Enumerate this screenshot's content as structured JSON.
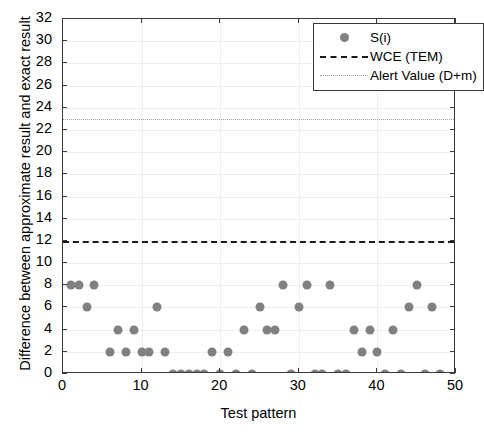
{
  "chart_data": {
    "type": "scatter",
    "title": "",
    "xlabel": "Test pattern",
    "ylabel": "Difference between approximate result and exact result",
    "xlim": [
      0,
      50
    ],
    "ylim": [
      0,
      32
    ],
    "xticks": [
      0,
      10,
      20,
      30,
      40,
      50
    ],
    "yticks": [
      0,
      2,
      4,
      6,
      8,
      10,
      12,
      14,
      16,
      18,
      20,
      22,
      24,
      26,
      28,
      30,
      32
    ],
    "grid": true,
    "legend_position": "top-right",
    "series": [
      {
        "name": "S(i)",
        "type": "scatter",
        "marker": "circle",
        "color": "#808080",
        "x": [
          1,
          2,
          3,
          4,
          6,
          7,
          8,
          9,
          10,
          11,
          12,
          13,
          14,
          15,
          16,
          17,
          18,
          19,
          20,
          21,
          22,
          23,
          24,
          25,
          26,
          27,
          28,
          29,
          30,
          31,
          32,
          33,
          34,
          35,
          36,
          37,
          38,
          39,
          40,
          41,
          42,
          43,
          44,
          45,
          46,
          47,
          48
        ],
        "y": [
          8,
          8,
          6,
          8,
          2,
          4,
          2,
          4,
          2,
          2,
          6,
          2,
          0,
          0,
          0,
          0,
          0,
          2,
          0,
          2,
          0,
          4,
          0,
          6,
          4,
          4,
          8,
          0,
          6,
          8,
          0,
          0,
          8,
          0,
          0,
          4,
          2,
          4,
          2,
          0,
          4,
          0,
          6,
          8,
          0,
          6,
          0
        ]
      },
      {
        "name": "WCE (TEM)",
        "type": "hline",
        "value": 12,
        "style": "dashed",
        "color": "#1a1a1a"
      },
      {
        "name": "Alert Value (D+m)",
        "type": "hline",
        "value": 23,
        "style": "dotted",
        "color": "#9a9a9a"
      }
    ]
  },
  "legend": {
    "items": [
      {
        "label": "S(i)"
      },
      {
        "label": "WCE (TEM)"
      },
      {
        "label": "Alert Value (D+m)"
      }
    ]
  },
  "axes": {
    "x_title": "Test pattern",
    "y_title": "Difference between approximate result and exact result",
    "x_tick_labels": [
      "0",
      "10",
      "20",
      "30",
      "40",
      "50"
    ],
    "y_tick_labels": [
      "0",
      "2",
      "4",
      "6",
      "8",
      "10",
      "12",
      "14",
      "16",
      "18",
      "20",
      "22",
      "24",
      "26",
      "28",
      "30",
      "32"
    ]
  },
  "colors": {
    "marker": "#808080",
    "wce_line": "#1a1a1a",
    "alert_line": "#9a9a9a",
    "axis": "#3a3a3a",
    "grid": "#eeeeee"
  }
}
